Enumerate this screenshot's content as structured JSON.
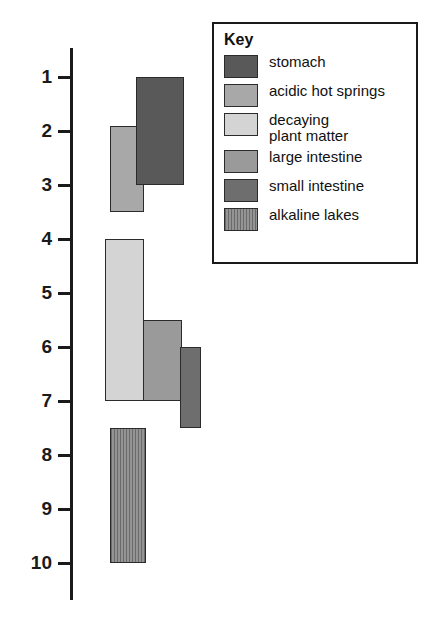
{
  "chart_data": {
    "type": "bar",
    "orientation": "vertical-range",
    "title": "",
    "xlabel": "",
    "ylabel": "",
    "ylim": [
      0.4,
      10.4
    ],
    "y_axis_inverted": true,
    "grid": false,
    "legend_position": "top-right",
    "tick_labels": [
      "1",
      "2",
      "3",
      "4",
      "5",
      "6",
      "7",
      "8",
      "9",
      "10"
    ],
    "tick_values": [
      1,
      2,
      3,
      4,
      5,
      6,
      7,
      8,
      9,
      10
    ],
    "legend_title": "Key",
    "series": [
      {
        "name": "stomach",
        "low": 1.0,
        "high": 3.0,
        "color": "#595959",
        "pattern": "solid",
        "x_left_px": 136,
        "x_width_px": 48
      },
      {
        "name": "acidic hot springs",
        "low": 1.9,
        "high": 3.5,
        "color": "#a8a8a8",
        "pattern": "solid",
        "x_left_px": 110,
        "x_width_px": 34
      },
      {
        "name": "decaying\nplant matter",
        "low": 4.0,
        "high": 7.0,
        "color": "#d4d4d4",
        "pattern": "solid",
        "x_left_px": 105,
        "x_width_px": 39
      },
      {
        "name": "large intestine",
        "low": 5.5,
        "high": 7.0,
        "color": "#9a9a9a",
        "pattern": "solid",
        "x_left_px": 143,
        "x_width_px": 39
      },
      {
        "name": "small intestine",
        "low": 6.0,
        "high": 7.5,
        "color": "#6e6e6e",
        "pattern": "solid",
        "x_left_px": 180,
        "x_width_px": 21
      },
      {
        "name": "alkaline lakes",
        "low": 7.5,
        "high": 10.0,
        "color": "#8a8a8a",
        "pattern": "vertical-hatch",
        "x_left_px": 110,
        "x_width_px": 36
      }
    ]
  },
  "legend": {
    "title": "Key",
    "items": [
      {
        "label": "stomach",
        "color": "#595959",
        "pattern": "solid"
      },
      {
        "label": "acidic hot springs",
        "color": "#a8a8a8",
        "pattern": "solid"
      },
      {
        "label": "decaying\nplant matter",
        "color": "#d4d4d4",
        "pattern": "solid"
      },
      {
        "label": "large intestine",
        "color": "#9a9a9a",
        "pattern": "solid"
      },
      {
        "label": "small intestine",
        "color": "#6e6e6e",
        "pattern": "solid"
      },
      {
        "label": "alkaline lakes",
        "color": "#8a8a8a",
        "pattern": "vertical-hatch"
      }
    ]
  },
  "axis": {
    "top_px": 77,
    "bottom_px": 563,
    "line_top_px": 48,
    "line_bottom_px": 600
  }
}
